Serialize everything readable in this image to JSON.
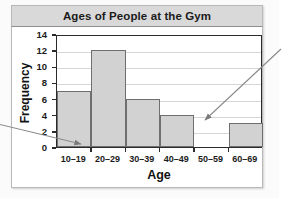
{
  "chart_data": {
    "type": "bar",
    "title": "Ages of People at the Gym",
    "xlabel": "Age",
    "ylabel": "Frequency",
    "categories": [
      "10–19",
      "20–29",
      "30–39",
      "40–49",
      "50–59",
      "60–69"
    ],
    "values": [
      7,
      12,
      6,
      4,
      0,
      3
    ],
    "ylim": [
      0,
      14
    ],
    "yticks": [
      0,
      2,
      4,
      6,
      8,
      10,
      12,
      14
    ],
    "ytick_labels": [
      "0",
      "2",
      "4",
      "6",
      "8",
      "10",
      "12",
      "14"
    ],
    "grid": true,
    "legend": "none",
    "bar_fill": "#d2d2d2",
    "bar_edge": "#6f6f6f",
    "axis_color": "#2b2b2b",
    "grid_color": "#d6d6d6",
    "title_band_color": "#d9d9d9",
    "annotations": [
      {
        "name": "left-pointer-arrow",
        "text": "",
        "target": "10–19 bin lower-left at baseline"
      },
      {
        "name": "right-pointer-arrow",
        "text": "",
        "target": "50–59 empty bin"
      }
    ]
  }
}
